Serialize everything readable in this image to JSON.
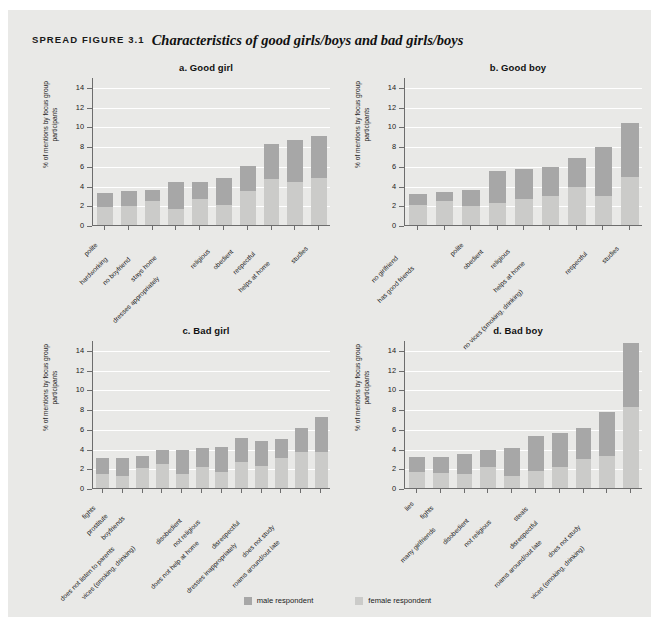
{
  "figure": {
    "lead": "SPREAD FIGURE 3.1",
    "title": "Characteristics of good girls/boys and bad girls/boys"
  },
  "legend": {
    "items": [
      {
        "label": "male respondent",
        "color": "#a7a7a7",
        "key": "male"
      },
      {
        "label": "female respondent",
        "color": "#cbcbc9",
        "key": "female"
      }
    ]
  },
  "axis": {
    "ylabel": "% of mentions by focus group participants",
    "yticks": [
      0,
      2,
      4,
      6,
      8,
      10,
      12,
      14
    ],
    "ymin": 0,
    "ymax": 15
  },
  "chart_data": [
    {
      "id": "a",
      "type": "bar",
      "title": "a. Good girl",
      "xlabel": "",
      "ylabel": "% of mentions by focus group participants",
      "ylim": [
        0,
        15
      ],
      "yticks": [
        0,
        2,
        4,
        6,
        8,
        10,
        12,
        14
      ],
      "grid": true,
      "stacked": true,
      "legend_position": "bottom",
      "categories": [
        "polite",
        "hardworking",
        "no boyfriend",
        "stays home",
        "dresses appropriately",
        "religious",
        "obedient",
        "respectful",
        "helps at home",
        "studies"
      ],
      "series": [
        {
          "name": "female respondent",
          "values": [
            1.8,
            1.9,
            2.4,
            1.6,
            2.6,
            2.0,
            3.4,
            4.7,
            4.4,
            4.8
          ]
        },
        {
          "name": "male respondent",
          "values": [
            1.4,
            1.5,
            1.2,
            2.8,
            1.8,
            2.8,
            2.6,
            3.5,
            4.2,
            4.2
          ]
        }
      ],
      "totals": [
        3.2,
        3.4,
        3.6,
        4.4,
        4.4,
        4.8,
        6.0,
        8.2,
        8.6,
        9.0
      ]
    },
    {
      "id": "b",
      "type": "bar",
      "title": "b. Good boy",
      "xlabel": "",
      "ylabel": "% of mentions by focus group participants",
      "ylim": [
        0,
        15
      ],
      "yticks": [
        0,
        2,
        4,
        6,
        8,
        10,
        12,
        14
      ],
      "grid": true,
      "stacked": true,
      "legend_position": "bottom",
      "categories": [
        "no girlfriend",
        "has good friends",
        "polite",
        "obedient",
        "religious",
        "helps at home",
        "no vices (smoking, drinking)",
        "respectful",
        "studies"
      ],
      "series": [
        {
          "name": "female respondent",
          "values": [
            2.0,
            2.4,
            1.9,
            2.2,
            2.6,
            2.9,
            3.9,
            2.9,
            4.9
          ]
        },
        {
          "name": "male respondent",
          "values": [
            1.1,
            0.9,
            1.6,
            3.3,
            3.1,
            3.0,
            2.9,
            5.0,
            5.4
          ]
        }
      ],
      "totals": [
        3.1,
        3.3,
        3.5,
        5.5,
        5.7,
        5.9,
        6.8,
        7.9,
        10.3
      ]
    },
    {
      "id": "c",
      "type": "bar",
      "title": "c. Bad girl",
      "xlabel": "",
      "ylabel": "% of mentions by focus group participants",
      "ylim": [
        0,
        15
      ],
      "yticks": [
        0,
        2,
        4,
        6,
        8,
        10,
        12,
        14
      ],
      "grid": true,
      "stacked": true,
      "legend_position": "bottom",
      "categories": [
        "fights",
        "prostitute",
        "boyfriends",
        "does not listen to parents",
        "vices (smoking, drinking)",
        "disobedient",
        "not religious",
        "does not help at home",
        "disrespectful",
        "dresses inappropriately",
        "does not study",
        "roams around/out late"
      ],
      "series": [
        {
          "name": "female respondent",
          "values": [
            1.4,
            1.2,
            2.0,
            2.4,
            1.4,
            2.1,
            1.6,
            2.6,
            2.2,
            3.0,
            3.6,
            3.7
          ]
        },
        {
          "name": "male respondent",
          "values": [
            1.6,
            1.8,
            1.2,
            1.5,
            2.5,
            2.0,
            2.6,
            2.5,
            2.6,
            2.0,
            2.5,
            3.5
          ]
        }
      ],
      "totals": [
        3.0,
        3.0,
        3.2,
        3.9,
        3.9,
        4.1,
        4.2,
        5.1,
        4.8,
        5.0,
        6.1,
        7.2
      ]
    },
    {
      "id": "d",
      "type": "bar",
      "title": "d. Bad boy",
      "xlabel": "",
      "ylabel": "% of mentions by focus group participants",
      "ylim": [
        0,
        15
      ],
      "yticks": [
        0,
        2,
        4,
        6,
        8,
        10,
        12,
        14
      ],
      "grid": true,
      "stacked": true,
      "legend_position": "bottom",
      "categories": [
        "lies",
        "fights",
        "many girlfriends",
        "disobedient",
        "not religious",
        "steals",
        "disrespectful",
        "roams around/out late",
        "does not study",
        "vices (smoking, drinking)"
      ],
      "series": [
        {
          "name": "female respondent",
          "values": [
            1.6,
            1.5,
            1.4,
            2.1,
            1.2,
            1.7,
            2.1,
            2.9,
            3.2,
            8.2
          ]
        },
        {
          "name": "male respondent",
          "values": [
            1.5,
            1.6,
            2.0,
            1.8,
            2.9,
            3.6,
            3.5,
            3.2,
            4.5,
            6.5
          ]
        }
      ],
      "totals": [
        3.1,
        3.1,
        3.4,
        3.9,
        4.1,
        5.3,
        5.6,
        6.1,
        7.7,
        14.7
      ]
    }
  ]
}
